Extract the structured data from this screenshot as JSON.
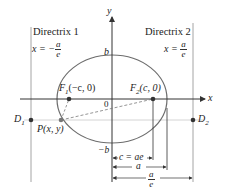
{
  "diagram": {
    "colors": {
      "ellipse": "#6d6d6d",
      "axes": "#333333",
      "directrix": "#9a9a9a",
      "guide": "#c9c9c9",
      "dashed": "#7a7a7a",
      "point": "#333333"
    },
    "axes": {
      "x_label": "x",
      "y_label": "y",
      "origin_label": "0"
    },
    "directrix1": {
      "title": "Directrix 1",
      "eq_lhs": "x = −",
      "eq_num": "a",
      "eq_den": "e"
    },
    "directrix2": {
      "title": "Directrix 2",
      "eq_lhs": "x = ",
      "eq_num": "a",
      "eq_den": "e"
    },
    "points": {
      "f1": {
        "name": "F",
        "sub": "1",
        "coords": "(−c, 0)"
      },
      "f2": {
        "name": "F",
        "sub": "2",
        "coords": "(c, 0)"
      },
      "p": {
        "label": "P(x, y)"
      },
      "d1": {
        "name": "D",
        "sub": "1"
      },
      "d2": {
        "name": "D",
        "sub": "2"
      }
    },
    "intercepts": {
      "top": "b",
      "bottom": "−b"
    },
    "dimensions": {
      "c": "c = ae",
      "a": "a",
      "a_over_e_num": "a",
      "a_over_e_den": "e"
    }
  }
}
